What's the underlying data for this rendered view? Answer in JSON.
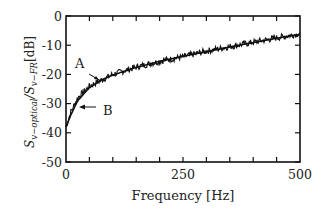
{
  "chart_data": {
    "type": "line",
    "title": "",
    "xlabel": "Frequency [Hz]",
    "ylabel": "S_{v-optical}/S_{v-FR} [dB]",
    "xlim": [
      0,
      500
    ],
    "ylim": [
      -50,
      0
    ],
    "xticks": [
      "0",
      "250",
      "500"
    ],
    "yticks": [
      "0",
      "-10",
      "-20",
      "-30",
      "-40",
      "-50"
    ],
    "grid": false,
    "legend": null,
    "annotations": [
      {
        "text": "A",
        "points_to": "measured (noisy) curve",
        "at": {
          "x": 55,
          "y": -22
        }
      },
      {
        "text": "B",
        "points_to": "theoretical (smooth) curve",
        "at": {
          "x": 25,
          "y": -31
        }
      }
    ],
    "series": [
      {
        "name": "A (measured)",
        "x": [
          0,
          10,
          25,
          50,
          75,
          100,
          150,
          200,
          250,
          300,
          350,
          400,
          450,
          500
        ],
        "values": [
          -38,
          -33,
          -28,
          -24,
          -22,
          -20,
          -17.5,
          -15.5,
          -14,
          -12,
          -10.5,
          -9,
          -7.5,
          -6
        ]
      },
      {
        "name": "B (theory)",
        "x": [
          0,
          10,
          25,
          50,
          75,
          100,
          150,
          200,
          250,
          300,
          350,
          400,
          450,
          500
        ],
        "values": [
          -38,
          -34,
          -29,
          -24.5,
          -22,
          -20.2,
          -17.6,
          -15.5,
          -13.8,
          -12.2,
          -10.6,
          -9.1,
          -7.6,
          -6.3
        ]
      }
    ]
  },
  "labels": {
    "xlabel": "Frequency [Hz]",
    "ylabel_main": "S",
    "ylabel_sub1": "v−optical",
    "ylabel_mid": "/S",
    "ylabel_sub2": "v−FR",
    "ylabel_unit": "[dB]",
    "annot_a": "A",
    "annot_b": "B"
  }
}
